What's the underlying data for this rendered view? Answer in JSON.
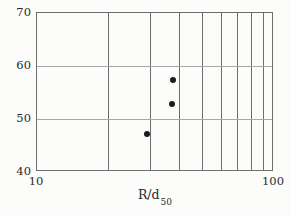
{
  "figure": {
    "background": "#fcfcfb"
  },
  "chart_data": {
    "type": "scatter",
    "title": "",
    "xlabel_main": "R/d",
    "xlabel_sub": "50",
    "ylabel": "",
    "x_scale": "log",
    "xlim": [
      10,
      100
    ],
    "ylim": [
      40,
      70
    ],
    "x_ticks": [
      10,
      100
    ],
    "x_tick_labels": [
      "10",
      "100"
    ],
    "y_ticks": [
      40,
      50,
      60,
      70
    ],
    "y_tick_labels": [
      "40",
      "50",
      "60",
      "70"
    ],
    "x_gridlines": [
      20,
      30,
      40,
      50,
      60,
      70,
      80,
      90
    ],
    "y_gridlines": [
      50,
      60
    ],
    "grid": true,
    "legend": "none",
    "points": [
      {
        "x": 29,
        "y": 47.1
      },
      {
        "x": 37.1,
        "y": 52.8
      },
      {
        "x": 37.5,
        "y": 57.3
      }
    ],
    "colors": {
      "marker": "#1c1c1c",
      "grid_vertical": "#6e6e6e",
      "grid_horizontal": "#a6a6a6",
      "border": "#6e6e6e",
      "text": "#2a2a2a"
    }
  }
}
